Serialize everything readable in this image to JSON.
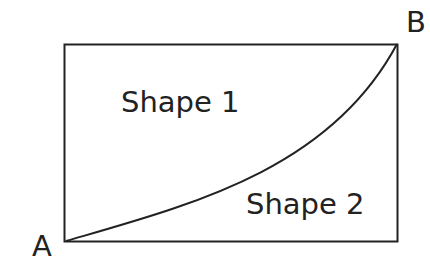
{
  "diagram": {
    "labels": {
      "point_a": "A",
      "point_b": "B",
      "shape_1": "Shape 1",
      "shape_2": "Shape 2"
    },
    "rectangle": {
      "x": 64,
      "y": 44,
      "width": 334,
      "height": 197
    },
    "curve": {
      "from": "A",
      "to": "B",
      "stroke": "#222222"
    }
  }
}
